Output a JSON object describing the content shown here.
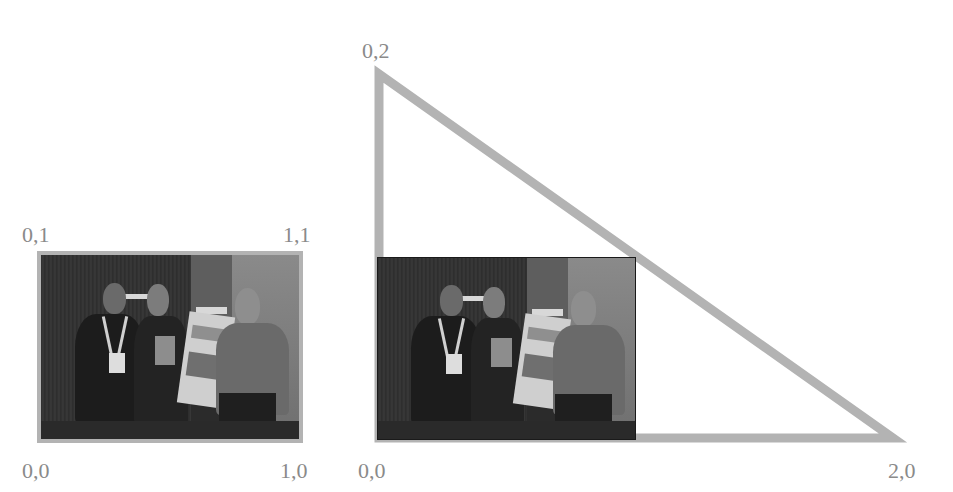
{
  "diagram": {
    "stroke_color": "#b3b3b3",
    "label_color": "#8a8a8a",
    "left_square": {
      "corner_labels": {
        "top_left": "0,1",
        "top_right": "1,1",
        "bottom_left": "0,0",
        "bottom_right": "1,0"
      },
      "image": "photo-three-people-with-poster"
    },
    "right_triangle": {
      "vertex_labels": {
        "top": "0,2",
        "bottom_left": "0,0",
        "bottom_right": "2,0"
      },
      "image": "photo-three-people-with-poster"
    }
  }
}
